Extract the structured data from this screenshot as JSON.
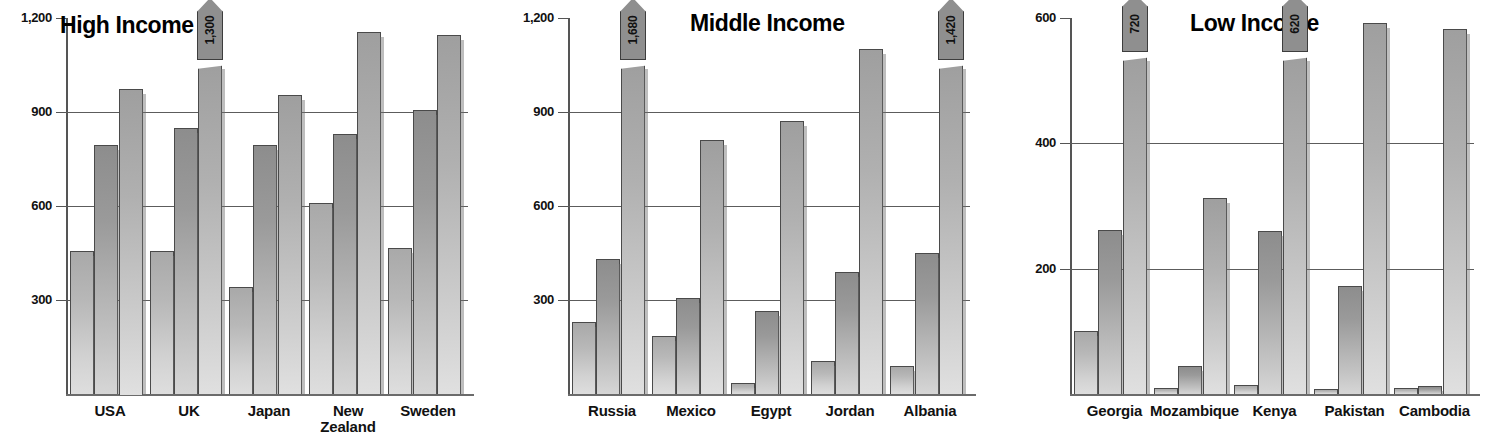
{
  "chart_data": [
    {
      "type": "bar",
      "title": "High Income",
      "xlabel": "",
      "ylabel": "",
      "ylim": [
        0,
        1200
      ],
      "yticks": [
        300,
        600,
        900,
        1200
      ],
      "ytick_labels": [
        "300",
        "600",
        "900",
        "1,200"
      ],
      "grid": true,
      "legend": "none",
      "categories": [
        "USA",
        "UK",
        "Japan",
        "New\nZealand",
        "Sweden"
      ],
      "series": [
        {
          "name": "series-1",
          "values": [
            455,
            455,
            340,
            610,
            465
          ]
        },
        {
          "name": "series-2",
          "values": [
            795,
            850,
            795,
            830,
            905
          ]
        },
        {
          "name": "series-3",
          "values": [
            975,
            1300,
            955,
            1155,
            1145
          ]
        }
      ],
      "annotations": [
        {
          "category": "UK",
          "series": "series-3",
          "label": "1,300",
          "style": "broken-bar-flag"
        }
      ]
    },
    {
      "type": "bar",
      "title": "Middle Income",
      "xlabel": "",
      "ylabel": "",
      "ylim": [
        0,
        1200
      ],
      "yticks": [
        300,
        600,
        900,
        1200
      ],
      "ytick_labels": [
        "300",
        "600",
        "900",
        "1,200"
      ],
      "grid": true,
      "legend": "none",
      "categories": [
        "Russia",
        "Mexico",
        "Egypt",
        "Jordan",
        "Albania"
      ],
      "series": [
        {
          "name": "series-1",
          "values": [
            230,
            185,
            35,
            105,
            90
          ]
        },
        {
          "name": "series-2",
          "values": [
            430,
            305,
            265,
            390,
            450
          ]
        },
        {
          "name": "series-3",
          "values": [
            1680,
            810,
            870,
            1100,
            1420
          ]
        }
      ],
      "annotations": [
        {
          "category": "Russia",
          "series": "series-3",
          "label": "1,680",
          "style": "broken-bar-flag"
        },
        {
          "category": "Albania",
          "series": "series-3",
          "label": "1,420",
          "style": "broken-bar-flag"
        }
      ]
    },
    {
      "type": "bar",
      "title": "Low Income",
      "xlabel": "",
      "ylabel": "",
      "ylim": [
        0,
        600
      ],
      "yticks": [
        200,
        400,
        600
      ],
      "ytick_labels": [
        "200",
        "400",
        "600"
      ],
      "grid": true,
      "legend": "none",
      "categories": [
        "Georgia",
        "Mozambique",
        "Kenya",
        "Pakistan",
        "Cambodia"
      ],
      "series": [
        {
          "name": "series-1",
          "values": [
            100,
            10,
            15,
            8,
            10
          ]
        },
        {
          "name": "series-2",
          "values": [
            262,
            45,
            260,
            172,
            12
          ]
        },
        {
          "name": "series-3",
          "values": [
            720,
            312,
            620,
            592,
            582
          ]
        }
      ],
      "annotations": [
        {
          "category": "Georgia",
          "series": "series-3",
          "label": "720",
          "style": "broken-bar-flag"
        },
        {
          "category": "Kenya",
          "series": "series-3",
          "label": "620",
          "style": "broken-bar-flag"
        }
      ]
    }
  ],
  "colors": {
    "series_1": "#c4c4c4",
    "series_2": "#a0a0a0",
    "series_3": "#bdbdbd",
    "grid": "#5c5c5c",
    "axis": "#555555",
    "flag_fill": "#8f8f8f",
    "text": "#111111"
  }
}
